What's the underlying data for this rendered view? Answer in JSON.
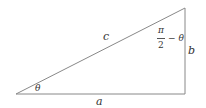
{
  "diagram": {
    "type": "right-triangle",
    "vertices": {
      "bottom_left": [
        16,
        94
      ],
      "bottom_right": [
        185,
        94
      ],
      "top_right": [
        185,
        8
      ]
    },
    "line_color": "#888888",
    "labels": {
      "hypotenuse": "c",
      "base": "a",
      "height": "b",
      "angle_bottom_left": "θ",
      "angle_top_numerator": "π",
      "angle_top_denominator": "2",
      "angle_top_suffix": "− θ"
    }
  }
}
